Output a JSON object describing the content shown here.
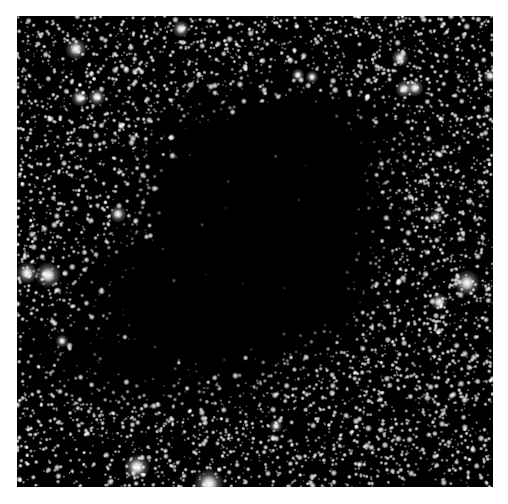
{
  "image": {
    "subject": "dark nebula against dense star field",
    "frame": {
      "left": 17,
      "top": 16,
      "width": 476,
      "height": 471
    },
    "background_color": "#ffffff",
    "sky_color": "#000000",
    "star_color": "#ffffff"
  },
  "starfield": {
    "seed": 1968,
    "faint_star_count": 5200,
    "medium_star_count": 700
  },
  "dark_cloud": {
    "description": "opaque dust cloud blocking background stars, centered slightly left of middle, extending toward lower-left",
    "lobes": [
      {
        "cx": 258,
        "cy": 230,
        "rx": 130,
        "ry": 145
      },
      {
        "cx": 200,
        "cy": 300,
        "rx": 115,
        "ry": 95
      },
      {
        "cx": 140,
        "cy": 355,
        "rx": 95,
        "ry": 45
      },
      {
        "cx": 300,
        "cy": 160,
        "rx": 95,
        "ry": 80
      }
    ],
    "edge_softness": 38
  },
  "bright_stars": [
    {
      "x": 27,
      "y": 273,
      "r": 5
    },
    {
      "x": 48,
      "y": 275,
      "r": 6
    },
    {
      "x": 76,
      "y": 49,
      "r": 5
    },
    {
      "x": 97,
      "y": 97,
      "r": 4
    },
    {
      "x": 80,
      "y": 98,
      "r": 4
    },
    {
      "x": 118,
      "y": 214,
      "r": 4
    },
    {
      "x": 137,
      "y": 467,
      "r": 6
    },
    {
      "x": 209,
      "y": 484,
      "r": 7
    },
    {
      "x": 467,
      "y": 283,
      "r": 6
    },
    {
      "x": 439,
      "y": 302,
      "r": 4
    },
    {
      "x": 404,
      "y": 89,
      "r": 4
    },
    {
      "x": 400,
      "y": 58,
      "r": 4
    },
    {
      "x": 415,
      "y": 88,
      "r": 4
    },
    {
      "x": 181,
      "y": 29,
      "r": 4
    },
    {
      "x": 312,
      "y": 77,
      "r": 3
    },
    {
      "x": 298,
      "y": 75,
      "r": 3
    },
    {
      "x": 276,
      "y": 426,
      "r": 3
    },
    {
      "x": 490,
      "y": 76,
      "r": 3
    },
    {
      "x": 62,
      "y": 341,
      "r": 3
    },
    {
      "x": 436,
      "y": 217,
      "r": 3
    }
  ]
}
